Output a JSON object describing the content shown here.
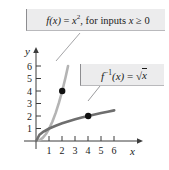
{
  "figure": {
    "background_color": "#ffffff"
  },
  "callouts": [
    {
      "name": "function-label",
      "text": "f(x) = x², for inputs x ≥ 0",
      "parts": {
        "fn": "f",
        "arg": "(x)",
        "equals": "=",
        "base": "x",
        "exponent": "2",
        "tail": ", for inputs",
        "var": "x",
        "relation": "≥",
        "bound": "0"
      },
      "fill_color": "#ececed",
      "border_color": "#8d8d90"
    },
    {
      "name": "inverse-function-label",
      "text": "f⁻¹(x) = √x",
      "parts": {
        "fn": "f",
        "exponent": "-1",
        "arg": "(x)",
        "equals": "=",
        "radical": "√",
        "radicand": "x"
      },
      "fill_color": "#ececed",
      "border_color": "#8d8d90"
    }
  ],
  "axes": {
    "x_label": "x",
    "y_label": "y",
    "x_ticks": [
      "1",
      "2",
      "3",
      "4",
      "5",
      "6"
    ],
    "y_ticks": [
      "1",
      "2",
      "3",
      "4",
      "5",
      "6"
    ],
    "axis_color": "#3c3c3c"
  },
  "chart_data": {
    "type": "line",
    "title": "",
    "xlabel": "x",
    "ylabel": "y",
    "xlim": [
      0,
      6.8
    ],
    "ylim": [
      0,
      6.6
    ],
    "grid": false,
    "legend": "callout-boxes",
    "x_ticks": [
      1,
      2,
      3,
      4,
      5,
      6
    ],
    "y_ticks": [
      1,
      2,
      3,
      4,
      5,
      6
    ],
    "series": [
      {
        "name": "f(x) = x^2",
        "color": "#b4b4b4",
        "width": 2.6,
        "domain": [
          0,
          2.45
        ],
        "points": [
          {
            "x": 0.0,
            "y": 0.0
          },
          {
            "x": 0.25,
            "y": 0.0625
          },
          {
            "x": 0.5,
            "y": 0.25
          },
          {
            "x": 0.75,
            "y": 0.5625
          },
          {
            "x": 1.0,
            "y": 1.0
          },
          {
            "x": 1.25,
            "y": 1.5625
          },
          {
            "x": 1.5,
            "y": 2.25
          },
          {
            "x": 1.75,
            "y": 3.0625
          },
          {
            "x": 2.0,
            "y": 4.0
          },
          {
            "x": 2.25,
            "y": 5.0625
          },
          {
            "x": 2.45,
            "y": 6.0
          }
        ],
        "marker": {
          "x": 2,
          "y": 4,
          "color": "#111111",
          "radius": 3.2
        }
      },
      {
        "name": "f^-1(x) = sqrt(x)",
        "color": "#6e6e6e",
        "width": 2.6,
        "domain": [
          0,
          6.0
        ],
        "points": [
          {
            "x": 0.0,
            "y": 0.0
          },
          {
            "x": 0.25,
            "y": 0.5
          },
          {
            "x": 0.5,
            "y": 0.7071
          },
          {
            "x": 1.0,
            "y": 1.0
          },
          {
            "x": 1.5,
            "y": 1.2247
          },
          {
            "x": 2.0,
            "y": 1.4142
          },
          {
            "x": 2.5,
            "y": 1.5811
          },
          {
            "x": 3.0,
            "y": 1.7321
          },
          {
            "x": 3.5,
            "y": 1.8708
          },
          {
            "x": 4.0,
            "y": 2.0
          },
          {
            "x": 4.5,
            "y": 2.1213
          },
          {
            "x": 5.0,
            "y": 2.2361
          },
          {
            "x": 5.5,
            "y": 2.3452
          },
          {
            "x": 6.0,
            "y": 2.4495
          }
        ],
        "marker": {
          "x": 4,
          "y": 2,
          "color": "#111111",
          "radius": 3.2
        }
      }
    ],
    "annotations": [
      {
        "name": "leader-line-fx",
        "from": [
          78,
          37
        ],
        "to": [
          58,
          61
        ],
        "color": "#9a9a9d"
      },
      {
        "name": "leader-line-finv",
        "from": [
          99,
          86
        ],
        "to": [
          90,
          100
        ],
        "color": "#8e8e91"
      }
    ]
  }
}
